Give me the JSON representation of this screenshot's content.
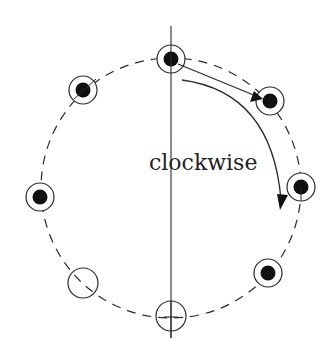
{
  "diagram": {
    "label": "clockwise",
    "colors": {
      "stroke": "#2a2a2a",
      "fill": "#111111",
      "background": "#ffffff"
    },
    "ring": {
      "cx": 171,
      "cy": 188,
      "r": 130,
      "style": "dashed"
    },
    "axis": {
      "x": 171,
      "y1": 26,
      "y2": 338
    },
    "nodes": [
      {
        "id": "top",
        "cx": 171,
        "cy": 59,
        "filled": true
      },
      {
        "id": "top-right",
        "cx": 270,
        "cy": 101,
        "filled": true
      },
      {
        "id": "right",
        "cx": 301,
        "cy": 187,
        "filled": true
      },
      {
        "id": "bottom-right",
        "cx": 268,
        "cy": 273,
        "filled": true
      },
      {
        "id": "bottom",
        "cx": 171,
        "cy": 316,
        "filled": false
      },
      {
        "id": "bottom-left",
        "cx": 83,
        "cy": 283,
        "filled": false
      },
      {
        "id": "left",
        "cx": 40,
        "cy": 197,
        "filled": true
      },
      {
        "id": "top-left",
        "cx": 83,
        "cy": 90,
        "filled": true
      }
    ],
    "arrows": [
      {
        "id": "short-arrow",
        "from": "top",
        "to": "top-right"
      },
      {
        "id": "long-arrow",
        "description": "curved clockwise arrow toward right node"
      }
    ]
  }
}
